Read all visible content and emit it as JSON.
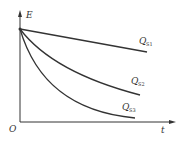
{
  "diagram": {
    "axes": {
      "y_label": "E",
      "x_label": "t",
      "origin_label": "O"
    },
    "curves": [
      {
        "name": "Q",
        "subscript": "S1",
        "shape": "linear-decrease"
      },
      {
        "name": "Q",
        "subscript": "S2",
        "shape": "moderate-decay"
      },
      {
        "name": "Q",
        "subscript": "S3",
        "shape": "fast-decay"
      }
    ],
    "colors": {
      "line": "#333333",
      "background": "#ffffff"
    }
  }
}
